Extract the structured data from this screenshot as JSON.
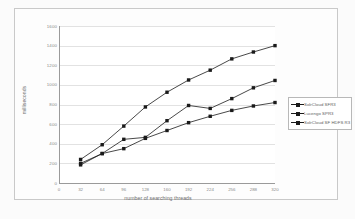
{
  "chart_data": {
    "type": "line",
    "title": "",
    "xlabel": "number of searching threads",
    "ylabel": "milliseconds",
    "x": [
      32,
      64,
      96,
      128,
      160,
      192,
      224,
      256,
      288,
      320
    ],
    "xlim": [
      0,
      320
    ],
    "ylim": [
      0,
      1600
    ],
    "xticks": [
      "0",
      "32",
      "64",
      "96",
      "128",
      "160",
      "192",
      "224",
      "256",
      "288",
      "320"
    ],
    "yticks": [
      "0",
      "200",
      "400",
      "600",
      "800",
      "1000",
      "1200",
      "1400",
      "1600"
    ],
    "grid": true,
    "legend_position": "right",
    "series": [
      {
        "name": "SolrCloud SFR3",
        "values": [
          185,
          300,
          350,
          455,
          535,
          615,
          680,
          740,
          785,
          820
        ]
      },
      {
        "name": "Lucengo SPR3",
        "values": [
          200,
          300,
          445,
          465,
          635,
          790,
          760,
          860,
          970,
          1045
        ]
      },
      {
        "name": "SolrCloud SF HDFS R3",
        "values": [
          240,
          390,
          580,
          775,
          925,
          1050,
          1150,
          1265,
          1335,
          1400
        ]
      }
    ]
  },
  "axis": {
    "x_title": "number of searching threads",
    "y_title": "milliseconds"
  }
}
